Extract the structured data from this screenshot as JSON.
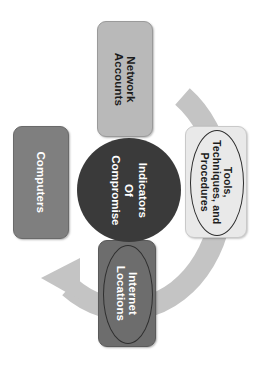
{
  "diagram": {
    "type": "cycle-diagram",
    "text_rotation_deg": 90,
    "background_color": "#ffffff",
    "ring": {
      "name": "circular-cycle-arrow",
      "color": "#c4c4c4",
      "arrow_direction": "counter-clockwise",
      "arrowhead_position": "bottom-left"
    },
    "center": {
      "label": "Indicators Of Compromise",
      "line1": "Indicators",
      "line2": "Of",
      "line3": "Compromise",
      "fill_color": "#3a3a3a",
      "text_color": "#ffffff",
      "shape": "circle"
    },
    "nodes": [
      {
        "id": "network-accounts",
        "position": "top",
        "label": "Network Accounts",
        "line1": "Network",
        "line2": "Accounts",
        "fill_color": "#b9b9b9",
        "text_color": "#1c1c1c",
        "shape": "rounded-rectangle",
        "has_ellipse_outline": false
      },
      {
        "id": "computers",
        "position": "left",
        "label": "Computers",
        "line1": "Computers",
        "fill_color": "#7f7f7f",
        "text_color": "#ffffff",
        "shape": "rounded-rectangle",
        "has_ellipse_outline": false
      },
      {
        "id": "tools-techniques-procedures",
        "position": "right",
        "label": "Tools, Techniques, and Procedures",
        "line1": "Tools,",
        "line2": "Techniques, and",
        "line3": "Procedures",
        "fill_color": "#e9e9e9",
        "text_color": "#1c1c1c",
        "shape": "rounded-rectangle",
        "has_ellipse_outline": true,
        "ellipse_color": "#2b2b2b"
      },
      {
        "id": "internet-locations",
        "position": "bottom",
        "label": "Internet Locations",
        "line1": "Internet",
        "line2": "Locations",
        "fill_color": "#6d6d6d",
        "text_color": "#ffffff",
        "shape": "rounded-rectangle",
        "has_ellipse_outline": true,
        "ellipse_color": "#2f2f2f"
      }
    ]
  }
}
